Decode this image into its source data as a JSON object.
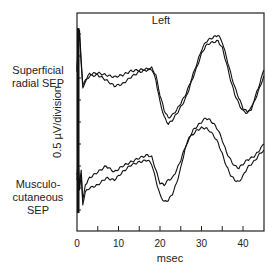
{
  "chart_data": {
    "type": "line",
    "title": "Left",
    "xlabel": "msec",
    "ylabel": "0.5 µV/division",
    "xlim": [
      0,
      45.5
    ],
    "x_ticks": [
      0,
      10,
      20,
      30,
      40
    ],
    "x_minor_ticks": [
      5,
      15,
      25,
      35
    ],
    "y_division_uV": 0.5,
    "grid": false,
    "legend": "none (traces labeled at left)",
    "trace_labels": {
      "upper": [
        "Superficial",
        "radial SEP"
      ],
      "lower": [
        "Musculo-",
        "cutaneous",
        "SEP"
      ]
    },
    "series": [
      {
        "name": "Superficial radial SEP - trial 1",
        "group": "upper",
        "x": [
          0,
          0.3,
          0.6,
          1.0,
          1.4,
          2,
          3,
          5,
          7,
          9,
          11,
          13,
          15,
          17,
          18,
          19,
          20,
          21,
          22,
          23,
          24,
          25,
          26,
          27,
          28,
          29,
          30,
          31,
          32,
          33,
          34,
          35,
          36,
          37,
          38,
          39,
          40,
          41,
          42,
          43,
          44,
          45
        ],
        "y_px": [
          70,
          40,
          30,
          60,
          85,
          80,
          74,
          73,
          75,
          77,
          75,
          71,
          70,
          69,
          68,
          75,
          95,
          110,
          118,
          115,
          110,
          103,
          96,
          86,
          74,
          62,
          50,
          42,
          39,
          37,
          35,
          42,
          57,
          73,
          87,
          98,
          108,
          112,
          108,
          96,
          84,
          70
        ]
      },
      {
        "name": "Superficial radial SEP - trial 2",
        "group": "upper",
        "x": [
          0,
          0.3,
          0.6,
          1.0,
          1.4,
          2,
          3,
          5,
          7,
          9,
          11,
          13,
          15,
          17,
          18,
          19,
          20,
          21,
          22,
          23,
          24,
          25,
          26,
          27,
          28,
          29,
          30,
          31,
          32,
          33,
          34,
          35,
          36,
          37,
          38,
          39,
          40,
          41,
          42,
          43,
          44,
          45
        ],
        "y_px": [
          72,
          44,
          34,
          64,
          88,
          82,
          76,
          75,
          80,
          86,
          84,
          77,
          72,
          70,
          69,
          80,
          102,
          117,
          124,
          120,
          114,
          107,
          100,
          89,
          77,
          66,
          54,
          46,
          43,
          42,
          41,
          48,
          63,
          80,
          94,
          104,
          111,
          113,
          109,
          99,
          88,
          76
        ]
      },
      {
        "name": "Musculocutaneous SEP - trial 1",
        "group": "lower",
        "x": [
          0,
          0.3,
          0.6,
          1.0,
          1.4,
          2,
          3,
          5,
          7,
          9,
          11,
          13,
          15,
          17,
          18,
          19,
          20,
          21,
          22,
          23,
          24,
          25,
          26,
          27,
          28,
          29,
          30,
          31,
          32,
          33,
          34,
          35,
          36,
          37,
          38,
          39,
          40,
          41,
          42,
          43,
          44,
          45
        ],
        "y_px": [
          175,
          160,
          185,
          170,
          200,
          185,
          178,
          172,
          166,
          172,
          166,
          162,
          158,
          155,
          157,
          170,
          183,
          185,
          180,
          178,
          170,
          160,
          148,
          138,
          130,
          126,
          122,
          118,
          120,
          124,
          130,
          140,
          152,
          160,
          166,
          168,
          164,
          160,
          158,
          155,
          150,
          144
        ]
      },
      {
        "name": "Musculocutaneous SEP - trial 2",
        "group": "lower",
        "x": [
          0,
          0.3,
          0.6,
          1.0,
          1.4,
          2,
          3,
          5,
          7,
          9,
          11,
          13,
          15,
          17,
          18,
          19,
          20,
          21,
          22,
          23,
          24,
          25,
          26,
          27,
          28,
          29,
          30,
          31,
          32,
          33,
          34,
          35,
          36,
          37,
          38,
          39,
          40,
          41,
          42,
          43,
          44,
          45
        ],
        "y_px": [
          180,
          165,
          190,
          175,
          205,
          192,
          188,
          185,
          178,
          180,
          172,
          165,
          162,
          160,
          164,
          180,
          195,
          202,
          200,
          194,
          183,
          168,
          150,
          138,
          134,
          130,
          128,
          128,
          131,
          136,
          143,
          154,
          166,
          175,
          180,
          182,
          176,
          168,
          164,
          160,
          154,
          150
        ]
      }
    ]
  },
  "figure": {
    "title": "Left",
    "ylabel": "0.5 µV/division",
    "xlabel": "msec",
    "x_tick_labels": [
      "0",
      "10",
      "20",
      "30",
      "40"
    ],
    "upper_label_lines": [
      "Superficial",
      "radial SEP"
    ],
    "lower_label_lines": [
      "Musculo-",
      "cutaneous",
      "SEP"
    ],
    "line_color": "#111111",
    "frame_color": "#222222"
  }
}
